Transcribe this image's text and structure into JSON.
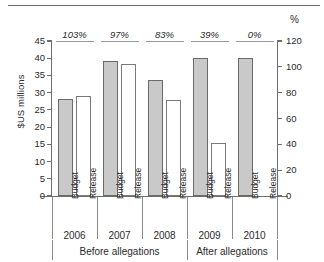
{
  "chart_data": {
    "type": "bar",
    "title": "",
    "ylabel": "$US millions",
    "y2label": "%",
    "xlabel": "",
    "ylim": [
      0,
      45
    ],
    "y2lim": [
      0,
      120
    ],
    "yticks": [
      "45",
      "40",
      "35",
      "30",
      "25",
      "20",
      "15",
      "10",
      "5",
      "0"
    ],
    "y2ticks": [
      "120",
      "100",
      "80",
      "60",
      "40",
      "20",
      "0"
    ],
    "grid": false,
    "legend_position": "none",
    "categories": [
      "2006",
      "2007",
      "2008",
      "2009",
      "2010"
    ],
    "bar_labels": [
      "Budget",
      "Release"
    ],
    "series": [
      {
        "name": "Budget",
        "values": [
          28.2,
          39.3,
          33.7,
          40.0,
          40.0
        ]
      },
      {
        "name": "Release",
        "values": [
          29.1,
          38.2,
          27.9,
          15.5,
          0
        ]
      }
    ],
    "annotations": [
      "103%",
      "97%",
      "83%",
      "39%",
      "0%"
    ],
    "groups": [
      {
        "label": "Before allegations",
        "categories": [
          "2006",
          "2007",
          "2008"
        ]
      },
      {
        "label": "After allegations",
        "categories": [
          "2009",
          "2010"
        ]
      }
    ],
    "colors": {
      "budget_fill": "#c9c9c9",
      "budget_edge": "#6a6a6a",
      "release_fill": "#ffffff",
      "release_edge": "#7a7a7a",
      "axis": "#6e6e6e",
      "text": "#2b2b2b"
    }
  }
}
